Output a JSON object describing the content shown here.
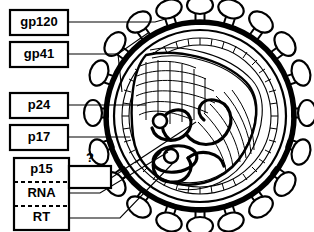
{
  "diagram": {
    "background_color": "#ffffff",
    "line_color": "#000000"
  },
  "labels": [
    {
      "id": "gp120",
      "text": "gp120",
      "box": {
        "x": 10,
        "y": 10,
        "w": 58,
        "h": 25
      }
    },
    {
      "id": "gp41",
      "text": "gp41",
      "box": {
        "x": 10,
        "y": 42,
        "w": 58,
        "h": 25
      }
    },
    {
      "id": "p24",
      "text": "p24",
      "box": {
        "x": 10,
        "y": 93,
        "w": 58,
        "h": 25
      }
    },
    {
      "id": "p17",
      "text": "p17",
      "box": {
        "x": 10,
        "y": 125,
        "w": 58,
        "h": 25
      }
    },
    {
      "id": "p15",
      "text": "p15",
      "box": {
        "x": 14,
        "y": 158,
        "w": 55,
        "h": 24
      }
    },
    {
      "id": "rna",
      "text": "RNA",
      "box": {
        "x": 14,
        "y": 182,
        "w": 55,
        "h": 24
      }
    },
    {
      "id": "rt",
      "text": "RT",
      "box": {
        "x": 14,
        "y": 206,
        "w": 55,
        "h": 24
      }
    }
  ],
  "unknown_marker": {
    "text": "?",
    "box": {
      "x": 69,
      "y": 166,
      "w": 42,
      "h": 22
    },
    "text_x": 90,
    "text_y": 162
  },
  "virion": {
    "center_x": 200,
    "center_y": 116,
    "outer_radius": 97,
    "membrane_gap": 8,
    "matrix_bead_radius": 78,
    "spike_count": 20,
    "parts": [
      {
        "name": "gp120",
        "description": "outer envelope knob glycoprotein"
      },
      {
        "name": "gp41",
        "description": "transmembrane stalk glycoprotein"
      },
      {
        "name": "p17",
        "description": "matrix beaded layer beneath lipid envelope"
      },
      {
        "name": "p24",
        "description": "conical capsid core wall"
      },
      {
        "name": "p15",
        "description": "nucleocapsid protein on RNA"
      },
      {
        "name": "RNA",
        "description": "two single-stranded RNA genome copies"
      },
      {
        "name": "RT",
        "description": "reverse transcriptase enzyme"
      }
    ]
  }
}
